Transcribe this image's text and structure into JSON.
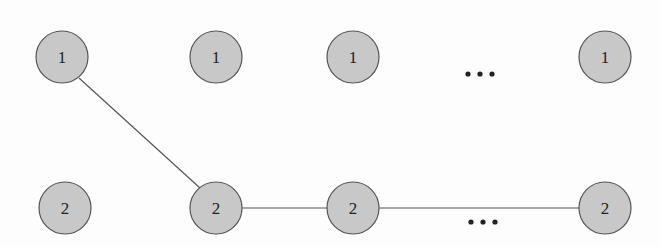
{
  "diagram": {
    "colors": {
      "node_fill": "#c8c8c8",
      "node_stroke": "#555555",
      "edge": "#555555",
      "dots": "#222222"
    },
    "nodes": [
      {
        "id": "t1",
        "label": "1",
        "row": "top",
        "x": 62,
        "y": 57
      },
      {
        "id": "t2",
        "label": "1",
        "row": "top",
        "x": 216,
        "y": 57
      },
      {
        "id": "t3",
        "label": "1",
        "row": "top",
        "x": 353,
        "y": 57
      },
      {
        "id": "t4",
        "label": "1",
        "row": "top",
        "x": 605,
        "y": 57
      },
      {
        "id": "b1",
        "label": "2",
        "row": "bottom",
        "x": 65,
        "y": 208
      },
      {
        "id": "b2",
        "label": "2",
        "row": "bottom",
        "x": 216,
        "y": 208
      },
      {
        "id": "b3",
        "label": "2",
        "row": "bottom",
        "x": 353,
        "y": 208
      },
      {
        "id": "b4",
        "label": "2",
        "row": "bottom",
        "x": 605,
        "y": 208
      }
    ],
    "edges": [
      {
        "from": "t1",
        "to": "b2"
      },
      {
        "from": "b2",
        "to": "b3"
      },
      {
        "from": "b3",
        "to": "b4"
      }
    ],
    "ellipses": [
      {
        "text": "...",
        "x": 480,
        "y": 70
      },
      {
        "text": "...",
        "x": 482,
        "y": 221
      }
    ]
  }
}
